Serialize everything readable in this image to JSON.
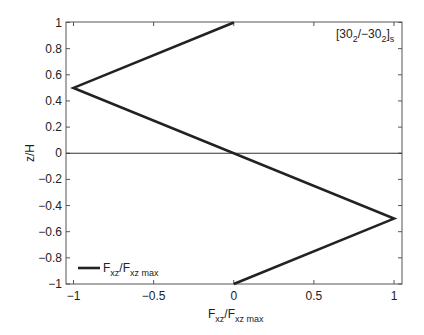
{
  "chart_data": {
    "type": "line",
    "title": "",
    "annotation": "[30_2/-30_2]_s",
    "annotation_parts": {
      "open": "[30",
      "sub1": "2",
      "mid": "/−30",
      "sub2": "2",
      "close": "]",
      "sub3": "s"
    },
    "xlabel": "F_xz/F_xz max",
    "xlabel_parts": {
      "a": "F",
      "a_sub": "xz",
      "b": "/F",
      "b_sub": "xz max"
    },
    "ylabel": "z/H",
    "xlim": [
      -1,
      1
    ],
    "ylim": [
      -1,
      1
    ],
    "xticks": [
      -1,
      -0.5,
      0,
      0.5,
      1
    ],
    "xtick_labels": [
      "−1",
      "−0.5",
      "0",
      "0.5",
      "1"
    ],
    "yticks": [
      1,
      0.8,
      0.6,
      0.4,
      0.2,
      0,
      -0.2,
      -0.4,
      -0.6,
      -0.8,
      -1
    ],
    "ytick_labels": [
      "1",
      "0.8",
      "0.6",
      "0.4",
      "0.2",
      "0",
      "−0.2",
      "−0.4",
      "−0.6",
      "−0.8",
      "−1"
    ],
    "grid": false,
    "reference_line": {
      "y": 0
    },
    "legend": {
      "position": "lower left",
      "entries": [
        "F_xz/F_xz max"
      ]
    },
    "series": [
      {
        "name": "F_xz/F_xz max",
        "color": "#222222",
        "x": [
          0,
          -1,
          1,
          0
        ],
        "y": [
          1,
          0.5,
          -0.5,
          -1
        ]
      }
    ]
  }
}
